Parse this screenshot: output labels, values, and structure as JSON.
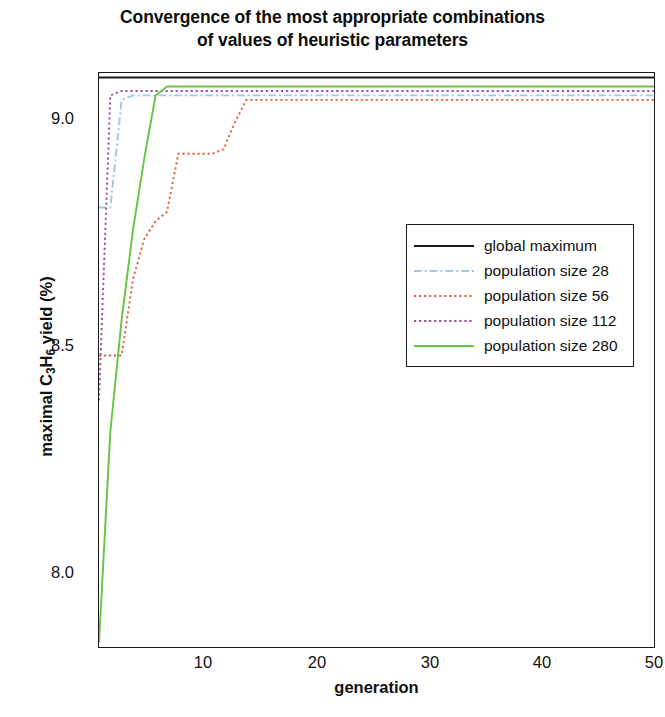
{
  "title": "Convergence of the most appropriate combinations\nof values of heuristic parameters",
  "axes": {
    "x_label": "generation",
    "y_label_prefix": "maximal C",
    "y_label_sub1": "3",
    "y_label_mid": "H",
    "y_label_sub2": "6",
    "y_label_suffix": " yield (%)",
    "y_label_plain": "maximal C3H6 yield (%)",
    "x_ticks": [
      "10",
      "20",
      "30",
      "40",
      "50"
    ],
    "y_ticks": [
      "8.0",
      "8.5",
      "9.0"
    ]
  },
  "legend": {
    "items": [
      {
        "label": "global maximum",
        "color": "#1a1a1a",
        "style": "solid"
      },
      {
        "label": "population size 28",
        "color": "#9ec8ee",
        "style": "dashdot"
      },
      {
        "label": "population size 56",
        "color": "#e2603c",
        "style": "dotted"
      },
      {
        "label": "population size 112",
        "color": "#9b4f9b",
        "style": "dotted"
      },
      {
        "label": "population size 280",
        "color": "#66c442",
        "style": "solid"
      }
    ]
  },
  "chart_data": {
    "type": "line",
    "title": "Convergence of the most appropriate combinations of values of heuristic parameters",
    "xlabel": "generation",
    "ylabel": "maximal C3H6 yield (%)",
    "xlim": [
      1,
      50
    ],
    "ylim": [
      7.85,
      9.13
    ],
    "grid": false,
    "legend_position": "center-right",
    "x": [
      1,
      2,
      3,
      4,
      5,
      6,
      7,
      8,
      9,
      10,
      11,
      12,
      13,
      14,
      15,
      16,
      17,
      18,
      19,
      20,
      21,
      22,
      23,
      24,
      25,
      26,
      27,
      28,
      29,
      30,
      31,
      32,
      33,
      34,
      35,
      36,
      37,
      38,
      39,
      40,
      41,
      42,
      43,
      44,
      45,
      46,
      47,
      48,
      49,
      50
    ],
    "series": [
      {
        "name": "global maximum",
        "color": "#1a1a1a",
        "style": "solid",
        "values": [
          9.12,
          9.12,
          9.12,
          9.12,
          9.12,
          9.12,
          9.12,
          9.12,
          9.12,
          9.12,
          9.12,
          9.12,
          9.12,
          9.12,
          9.12,
          9.12,
          9.12,
          9.12,
          9.12,
          9.12,
          9.12,
          9.12,
          9.12,
          9.12,
          9.12,
          9.12,
          9.12,
          9.12,
          9.12,
          9.12,
          9.12,
          9.12,
          9.12,
          9.12,
          9.12,
          9.12,
          9.12,
          9.12,
          9.12,
          9.12,
          9.12,
          9.12,
          9.12,
          9.12,
          9.12,
          9.12,
          9.12,
          9.12,
          9.12,
          9.12
        ]
      },
      {
        "name": "population size 28",
        "color": "#9ec8ee",
        "style": "dashdot",
        "values": [
          8.83,
          8.83,
          9.07,
          9.08,
          9.08,
          9.08,
          9.08,
          9.08,
          9.08,
          9.08,
          9.08,
          9.08,
          9.08,
          9.08,
          9.08,
          9.08,
          9.08,
          9.08,
          9.08,
          9.08,
          9.08,
          9.08,
          9.08,
          9.08,
          9.08,
          9.08,
          9.08,
          9.08,
          9.08,
          9.08,
          9.08,
          9.08,
          9.08,
          9.08,
          9.08,
          9.08,
          9.08,
          9.08,
          9.08,
          9.08,
          9.08,
          9.08,
          9.08,
          9.08,
          9.08,
          9.08,
          9.08,
          9.08,
          9.08,
          9.08
        ]
      },
      {
        "name": "population size 56",
        "color": "#e2603c",
        "style": "dotted",
        "values": [
          8.5,
          8.5,
          8.5,
          8.67,
          8.76,
          8.8,
          8.82,
          8.95,
          8.95,
          8.95,
          8.95,
          8.96,
          9.02,
          9.07,
          9.07,
          9.07,
          9.07,
          9.07,
          9.07,
          9.07,
          9.07,
          9.07,
          9.07,
          9.07,
          9.07,
          9.07,
          9.07,
          9.07,
          9.07,
          9.07,
          9.07,
          9.07,
          9.07,
          9.07,
          9.07,
          9.07,
          9.07,
          9.07,
          9.07,
          9.07,
          9.07,
          9.07,
          9.07,
          9.07,
          9.07,
          9.07,
          9.07,
          9.07,
          9.07,
          9.07
        ]
      },
      {
        "name": "population size 112",
        "color": "#9b4f9b",
        "style": "dotted",
        "values": [
          8.4,
          9.08,
          9.09,
          9.09,
          9.09,
          9.09,
          9.09,
          9.09,
          9.09,
          9.09,
          9.09,
          9.09,
          9.09,
          9.09,
          9.09,
          9.09,
          9.09,
          9.09,
          9.09,
          9.09,
          9.09,
          9.09,
          9.09,
          9.09,
          9.09,
          9.09,
          9.09,
          9.09,
          9.09,
          9.09,
          9.09,
          9.09,
          9.09,
          9.09,
          9.09,
          9.09,
          9.09,
          9.09,
          9.09,
          9.09,
          9.09,
          9.09,
          9.09,
          9.09,
          9.09,
          9.09,
          9.09,
          9.09,
          9.09,
          9.09
        ]
      },
      {
        "name": "population size 280",
        "color": "#66c442",
        "style": "solid",
        "values": [
          7.86,
          8.33,
          8.58,
          8.78,
          8.94,
          9.08,
          9.1,
          9.1,
          9.1,
          9.1,
          9.1,
          9.1,
          9.1,
          9.1,
          9.1,
          9.1,
          9.1,
          9.1,
          9.1,
          9.1,
          9.1,
          9.1,
          9.1,
          9.1,
          9.1,
          9.1,
          9.1,
          9.1,
          9.1,
          9.1,
          9.1,
          9.1,
          9.1,
          9.1,
          9.1,
          9.1,
          9.1,
          9.1,
          9.1,
          9.1,
          9.1,
          9.1,
          9.1,
          9.1,
          9.1,
          9.1,
          9.1,
          9.1,
          9.1,
          9.1
        ]
      }
    ]
  }
}
